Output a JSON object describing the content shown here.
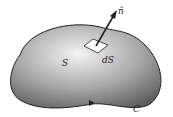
{
  "diagram": {
    "labels": {
      "surface": "S",
      "area_element": "dS",
      "normal": "n̂",
      "boundary": "C"
    },
    "colors": {
      "surface_light": "#f2f2f2",
      "surface_dark": "#6e6e6e",
      "outline": "#222222",
      "patch": "#ffffff"
    }
  }
}
